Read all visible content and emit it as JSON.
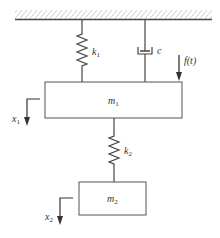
{
  "diagram": {
    "ground": {
      "label": "fixed support"
    },
    "components": {
      "spring1": {
        "symbol": "k",
        "subscript": "1"
      },
      "damper": {
        "symbol": "c"
      },
      "force": {
        "label": "f(t)"
      },
      "mass1": {
        "symbol": "m",
        "subscript": "1"
      },
      "disp1": {
        "symbol": "x",
        "subscript": "1"
      },
      "spring2": {
        "symbol": "k",
        "subscript": "2"
      },
      "mass2": {
        "symbol": "m",
        "subscript": "2"
      },
      "disp2": {
        "symbol": "x",
        "subscript": "2"
      }
    },
    "colors": {
      "line": "#444444",
      "text": "#333333"
    }
  }
}
